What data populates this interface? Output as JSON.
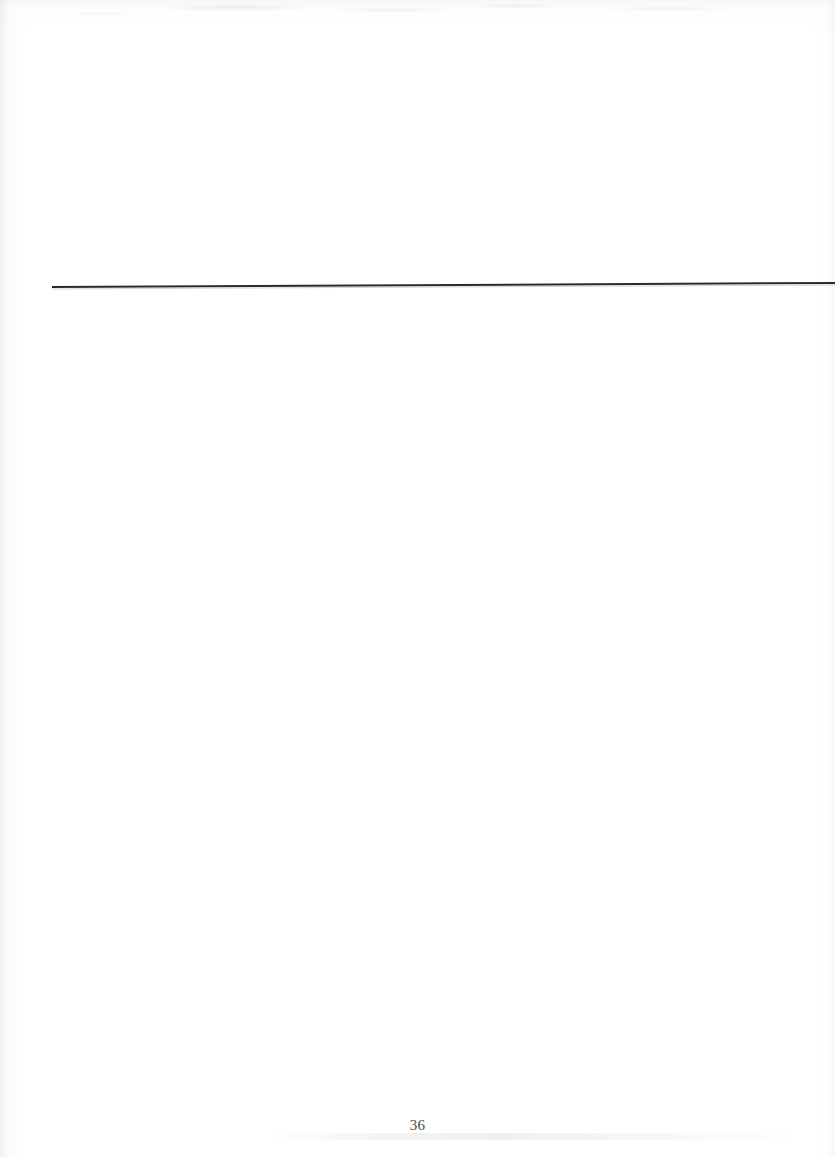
{
  "page": {
    "kind": "scanned-book-page",
    "background_color": "#ffffff",
    "width": 835,
    "height": 1157,
    "body_text": "",
    "body_note": "blank page body - no printed text"
  },
  "rule": {
    "name": "horizontal-rule",
    "color": "#2a2a2a",
    "start_x": 52,
    "end_x": 835,
    "y_left": 287,
    "y_right": 283,
    "thickness": 2
  },
  "footer": {
    "page_number": "36",
    "color": "#4a4a4a"
  }
}
